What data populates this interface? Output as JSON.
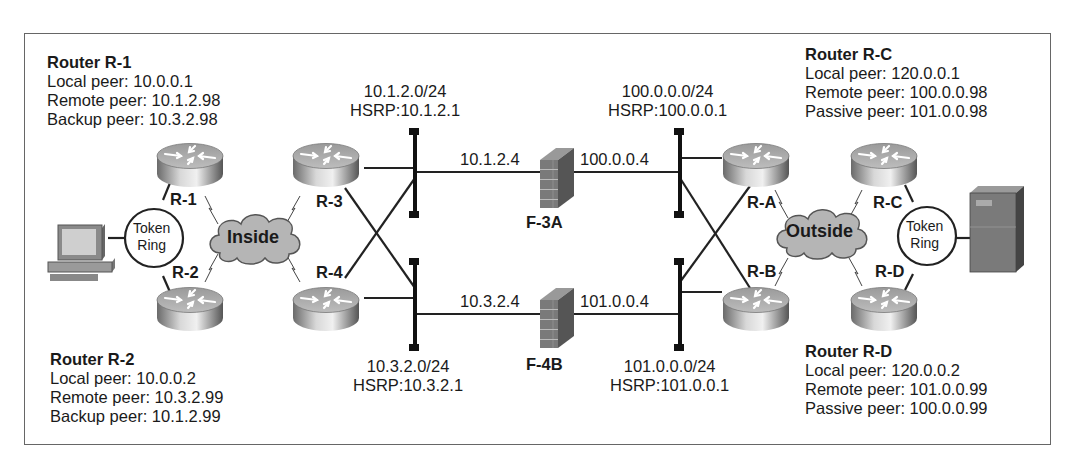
{
  "routers_info": {
    "r1": {
      "title": "Router R-1",
      "lines": [
        "Local peer: 10.0.0.1",
        "Remote peer: 10.1.2.98",
        "Backup peer: 10.3.2.98"
      ]
    },
    "r2": {
      "title": "Router R-2",
      "lines": [
        "Local peer: 10.0.0.2",
        "Remote peer: 10.3.2.99",
        "Backup peer: 10.1.2.99"
      ]
    },
    "rc": {
      "title": "Router R-C",
      "lines": [
        "Local peer: 120.0.0.1",
        "Remote peer: 100.0.0.98",
        "Passive peer: 101.0.0.98"
      ]
    },
    "rd": {
      "title": "Router R-D",
      "lines": [
        "Local peer: 120.0.0.2",
        "Remote peer: 101.0.0.99",
        "Passive peer: 100.0.0.99"
      ]
    }
  },
  "nodes": {
    "r1": "R-1",
    "r2": "R-2",
    "r3": "R-3",
    "r4": "R-4",
    "ra": "R-A",
    "rb": "R-B",
    "rc": "R-C",
    "rd": "R-D",
    "f3a": "F-3A",
    "f4b": "F-4B",
    "inside": "Inside",
    "outside": "Outside",
    "token_ring_left": [
      "Token",
      "Ring"
    ],
    "token_ring_right": [
      "Token",
      "Ring"
    ]
  },
  "segments": {
    "top_left": {
      "subnet": "10.1.2.0/24",
      "hsrp": "HSRP:10.1.2.1"
    },
    "bottom_left": {
      "subnet": "10.3.2.0/24",
      "hsrp": "HSRP:10.3.2.1"
    },
    "top_right": {
      "subnet": "100.0.0.0/24",
      "hsrp": "HSRP:100.0.0.1"
    },
    "bottom_right": {
      "subnet": "101.0.0.0/24",
      "hsrp": "HSRP:101.0.0.1"
    }
  },
  "links": {
    "f3a_inside": "10.1.2.4",
    "f3a_outside": "100.0.0.4",
    "f4b_inside": "10.3.2.4",
    "f4b_outside": "101.0.0.4"
  }
}
